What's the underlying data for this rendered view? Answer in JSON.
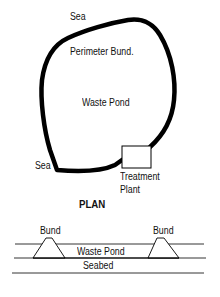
{
  "diagram": {
    "type": "waste pond plan and cross-section",
    "plan": {
      "labels": {
        "sea_top": "Sea",
        "perimeter_bund": "Perimeter Bund.",
        "waste_pond": "Waste Pond",
        "sea_left": "Sea",
        "treatment_plant_line1": "Treatment",
        "treatment_plant_line2": "Plant",
        "view_title": "PLAN"
      }
    },
    "section": {
      "labels": {
        "bund_left": "Bund",
        "bund_right": "Bund",
        "waste_pond": "Waste Pond",
        "seabed": "Seabed"
      }
    },
    "colors": {
      "line": "#000000",
      "background": "#ffffff"
    }
  }
}
